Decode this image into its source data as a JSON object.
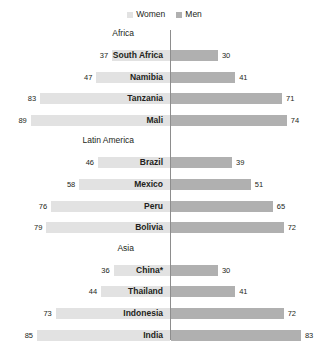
{
  "legend": {
    "items": [
      {
        "label": "Women",
        "color": "#e2e2e2",
        "icon": "square-swatch-icon"
      },
      {
        "label": "Men",
        "color": "#b0b0b0",
        "icon": "square-swatch-icon"
      }
    ]
  },
  "colors": {
    "women_bar": "#e2e2e2",
    "men_bar": "#b0b0b0",
    "axis": "#8d8d8d",
    "text": "#231f20",
    "background": "#ffffff"
  },
  "groups": [
    {
      "name": "Africa"
    },
    {
      "name": "Latin America"
    },
    {
      "name": "Asia"
    }
  ],
  "rows": [
    {
      "label": "South Africa",
      "women": 37,
      "men": 30,
      "group": "Africa"
    },
    {
      "label": "Namibia",
      "women": 47,
      "men": 41,
      "group": "Africa"
    },
    {
      "label": "Tanzania",
      "women": 83,
      "men": 71,
      "group": "Africa"
    },
    {
      "label": "Mali",
      "women": 89,
      "men": 74,
      "group": "Africa"
    },
    {
      "label": "Brazil",
      "women": 46,
      "men": 39,
      "group": "Latin America"
    },
    {
      "label": "Mexico",
      "women": 58,
      "men": 51,
      "group": "Latin America"
    },
    {
      "label": "Peru",
      "women": 76,
      "men": 65,
      "group": "Latin America"
    },
    {
      "label": "Bolivia",
      "women": 79,
      "men": 72,
      "group": "Latin America"
    },
    {
      "label": "China*",
      "women": 36,
      "men": 30,
      "group": "Asia"
    },
    {
      "label": "Thailand",
      "women": 44,
      "men": 41,
      "group": "Asia"
    },
    {
      "label": "Indonesia",
      "women": 73,
      "men": 72,
      "group": "Asia"
    },
    {
      "label": "India",
      "women": 85,
      "men": 83,
      "group": "Asia"
    }
  ],
  "chart_data": {
    "type": "bar",
    "subtype": "diverging-butterfly",
    "title": "",
    "xlabel": "",
    "ylabel": "",
    "orientation": "horizontal",
    "legend_position": "top-center",
    "grid": false,
    "axis_center": 0,
    "xlim": [
      0,
      90
    ],
    "categories": [
      "South Africa",
      "Namibia",
      "Tanzania",
      "Mali",
      "Brazil",
      "Mexico",
      "Peru",
      "Bolivia",
      "China*",
      "Thailand",
      "Indonesia",
      "India"
    ],
    "group_labels": [
      "Africa",
      "Latin America",
      "Asia"
    ],
    "group_membership": [
      "Africa",
      "Africa",
      "Africa",
      "Africa",
      "Latin America",
      "Latin America",
      "Latin America",
      "Latin America",
      "Asia",
      "Asia",
      "Asia",
      "Asia"
    ],
    "series": [
      {
        "name": "Women",
        "side": "left",
        "color": "#e2e2e2",
        "values": [
          37,
          47,
          83,
          89,
          46,
          58,
          76,
          79,
          36,
          44,
          73,
          85
        ]
      },
      {
        "name": "Men",
        "side": "right",
        "color": "#b0b0b0",
        "values": [
          30,
          41,
          71,
          74,
          39,
          51,
          65,
          72,
          30,
          41,
          72,
          83
        ]
      }
    ]
  }
}
